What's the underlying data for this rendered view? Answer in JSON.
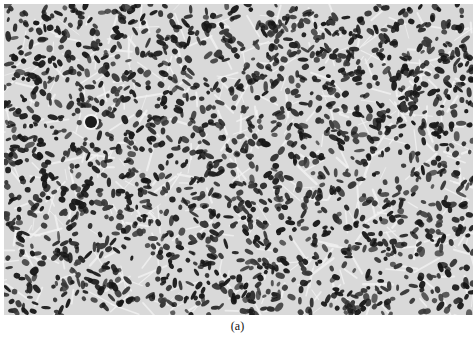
{
  "figure": {
    "caption": "(a)",
    "image": {
      "description": "Grayscale histology micrograph of densely packed, spindle-shaped and oval dark nuclei on a light fibrillar background",
      "colors": {
        "background": "#d9d9d9",
        "fibril": "#f2f2f2",
        "nucleus_dark": "#1a1a1a",
        "nucleus_mid": "#3a3a3a"
      },
      "texture": {
        "seed": 20240,
        "nucleus_count": 1900,
        "fibril_count": 420,
        "rx_range": [
          2.0,
          5.5
        ],
        "ry_range": [
          1.4,
          3.2
        ]
      },
      "notable_features": [
        {
          "type": "round-nucleus",
          "cx": 87,
          "cy": 118,
          "r": 6
        }
      ]
    }
  }
}
